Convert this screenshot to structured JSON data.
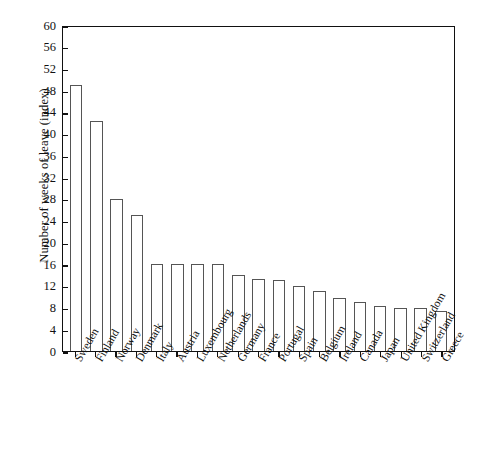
{
  "chart_data": {
    "type": "bar",
    "title": "",
    "xlabel": "",
    "ylabel": "Number of weeks of leave (index)",
    "ylim": [
      0,
      60
    ],
    "yticks": [
      0,
      4,
      8,
      12,
      16,
      20,
      24,
      28,
      32,
      36,
      40,
      44,
      48,
      52,
      56,
      60
    ],
    "grid": false,
    "legend": false,
    "categories": [
      "Sweden",
      "Finland",
      "Norway",
      "Denmark",
      "Italy",
      "Austria",
      "Luxembourg",
      "Netherlands",
      "Germany",
      "France",
      "Portugal",
      "Spain",
      "Belgium",
      "Ireland",
      "Canada",
      "Japan",
      "United Kingdom",
      "Switzerland",
      "Greece"
    ],
    "values": [
      49.0,
      42.3,
      28.0,
      25.0,
      16.0,
      16.0,
      16.0,
      16.0,
      14.0,
      13.3,
      13.0,
      12.0,
      11.0,
      9.7,
      9.0,
      8.2,
      8.0,
      8.0,
      7.4
    ]
  },
  "colors": {
    "axis": "#111111",
    "bar_fill": "#ffffff",
    "bar_stroke": "#555555",
    "background": "#ffffff"
  }
}
